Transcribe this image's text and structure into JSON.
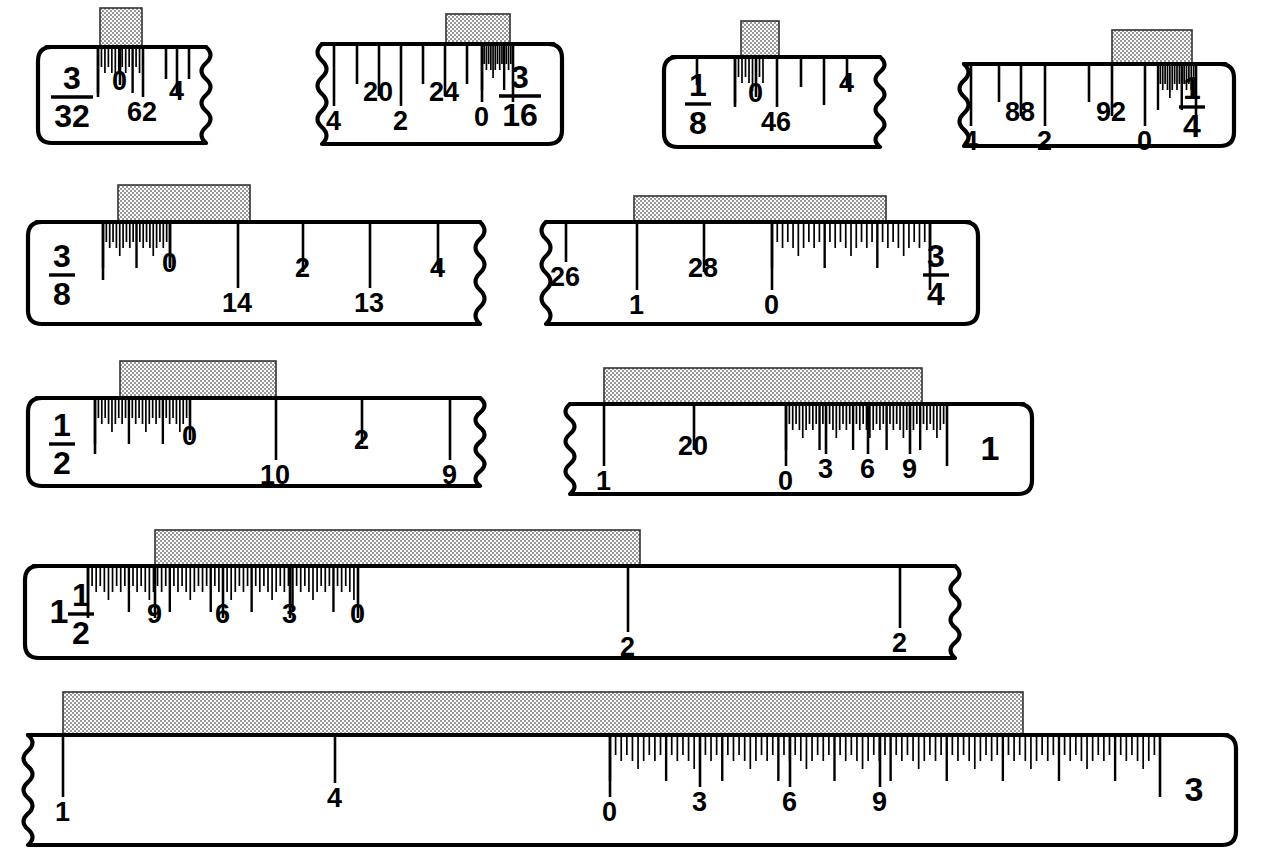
{
  "figure": {
    "type": "technical-illustration",
    "background_color": "#ffffff",
    "line_color": "#000000",
    "block_fill": "#b0b0b0",
    "block_pattern": "checkerboard-hatch",
    "rule_count": 10
  },
  "rules": [
    {
      "id": "rule-3-32",
      "size_label": {
        "numerator": "3",
        "denominator": "32"
      },
      "row": 1,
      "body": {
        "x": 38,
        "y": 47,
        "w": 168,
        "h": 96
      },
      "left_edge": "round",
      "right_edge": "torn",
      "block": {
        "x": 100,
        "y": 8,
        "w": 42,
        "h": 40
      },
      "fine_zone": {
        "x0": 98,
        "x1": 143,
        "count": 13
      },
      "major_ticks": [
        {
          "x": 98,
          "len": 50,
          "label": ""
        },
        {
          "x": 120,
          "len": 38,
          "label": "0",
          "label_pos": "upper"
        },
        {
          "x": 143,
          "len": 50,
          "label": "62",
          "label_pos": "lower"
        },
        {
          "x": 166,
          "len": 32,
          "label": ""
        },
        {
          "x": 177,
          "len": 48,
          "label": "4",
          "label_pos": "upper"
        },
        {
          "x": 189,
          "len": 32,
          "label": ""
        }
      ],
      "tick_labels": [
        "0",
        "62",
        "4"
      ]
    },
    {
      "id": "rule-3-16",
      "size_label": {
        "numerator": "3",
        "denominator": "16"
      },
      "row": 1,
      "body": {
        "x": 322,
        "y": 44,
        "w": 240,
        "h": 100
      },
      "left_edge": "torn",
      "right_edge": "round",
      "block": {
        "x": 446,
        "y": 14,
        "w": 64,
        "h": 34
      },
      "fine_zone": {
        "x0": 482,
        "x1": 513,
        "count": 14
      },
      "major_ticks": [
        {
          "x": 334,
          "len": 62,
          "label": "4",
          "label_pos": "lower"
        },
        {
          "x": 357,
          "len": 40,
          "label": ""
        },
        {
          "x": 379,
          "len": 52,
          "label": "20",
          "label_pos": "upper"
        },
        {
          "x": 401,
          "len": 62,
          "label": "2",
          "label_pos": "lower"
        },
        {
          "x": 423,
          "len": 40,
          "label": ""
        },
        {
          "x": 445,
          "len": 52,
          "label": "24",
          "label_pos": "upper"
        },
        {
          "x": 467,
          "len": 40,
          "label": ""
        },
        {
          "x": 482,
          "len": 58,
          "label": "0",
          "label_pos": "lower"
        },
        {
          "x": 513,
          "len": 58,
          "label": ""
        }
      ],
      "tick_labels": [
        "4",
        "20",
        "2",
        "24",
        "0"
      ]
    },
    {
      "id": "rule-1-8",
      "size_label": {
        "numerator": "1",
        "denominator": "8"
      },
      "row": 1,
      "body": {
        "x": 664,
        "y": 57,
        "w": 216,
        "h": 90
      },
      "left_edge": "round",
      "right_edge": "torn",
      "block": {
        "x": 741,
        "y": 21,
        "w": 38,
        "h": 36
      },
      "fine_zone": {
        "x0": 735,
        "x1": 763,
        "count": 8
      },
      "major_ticks": [
        {
          "x": 697,
          "len": 28,
          "label": ""
        },
        {
          "x": 735,
          "len": 50,
          "label": ""
        },
        {
          "x": 756,
          "len": 40,
          "label": "0",
          "label_pos": "upper"
        },
        {
          "x": 777,
          "len": 50,
          "label": "46",
          "label_pos": "lower"
        },
        {
          "x": 801,
          "len": 30,
          "label": ""
        },
        {
          "x": 824,
          "len": 48,
          "label": ""
        },
        {
          "x": 847,
          "len": 30,
          "label": "4",
          "label_pos": "upper"
        }
      ],
      "tick_labels": [
        "0",
        "46",
        "4"
      ]
    },
    {
      "id": "rule-1-4",
      "size_label": {
        "numerator": "1",
        "denominator": "4"
      },
      "row": 1,
      "body": {
        "x": 964,
        "y": 64,
        "w": 270,
        "h": 82
      },
      "left_edge": "torn",
      "right_edge": "round",
      "block": {
        "x": 1112,
        "y": 30,
        "w": 80,
        "h": 34
      },
      "fine_zone": {
        "x0": 1158,
        "x1": 1196,
        "count": 16
      },
      "major_ticks": [
        {
          "x": 971,
          "len": 62,
          "label": "4",
          "label_pos": "lower"
        },
        {
          "x": 999,
          "len": 38,
          "label": ""
        },
        {
          "x": 1021,
          "len": 52,
          "label": "88",
          "label_pos": "upper"
        },
        {
          "x": 1045,
          "len": 62,
          "label": "2",
          "label_pos": "lower"
        },
        {
          "x": 1089,
          "len": 38,
          "label": ""
        },
        {
          "x": 1112,
          "len": 52,
          "label": "92",
          "label_pos": "upper"
        },
        {
          "x": 1145,
          "len": 62,
          "label": "0",
          "label_pos": "lower"
        },
        {
          "x": 1196,
          "len": 62,
          "label": ""
        }
      ],
      "tick_labels": [
        "4",
        "88",
        "2",
        "92",
        "0"
      ]
    },
    {
      "id": "rule-3-8",
      "size_label": {
        "numerator": "3",
        "denominator": "8"
      },
      "row": 2,
      "body": {
        "x": 28,
        "y": 222,
        "w": 452,
        "h": 102
      },
      "left_edge": "round",
      "right_edge": "torn",
      "block": {
        "x": 118,
        "y": 185,
        "w": 132,
        "h": 37
      },
      "fine_zone": {
        "x0": 103,
        "x1": 170,
        "count": 20
      },
      "major_ticks": [
        {
          "x": 103,
          "len": 58,
          "label": ""
        },
        {
          "x": 170,
          "len": 45,
          "label": "0",
          "label_pos": "upper"
        },
        {
          "x": 238,
          "len": 66,
          "label": "14",
          "label_pos": "lower"
        },
        {
          "x": 303,
          "len": 50,
          "label": "2",
          "label_pos": "upper"
        },
        {
          "x": 370,
          "len": 66,
          "label": "13",
          "label_pos": "lower"
        },
        {
          "x": 438,
          "len": 50,
          "label": "4",
          "label_pos": "upper"
        }
      ],
      "tick_labels": [
        "0",
        "14",
        "2",
        "13",
        "4"
      ]
    },
    {
      "id": "rule-3-4",
      "size_label": {
        "numerator": "3",
        "denominator": "4"
      },
      "row": 2,
      "body": {
        "x": 546,
        "y": 222,
        "w": 432,
        "h": 102
      },
      "left_edge": "torn",
      "right_edge": "round",
      "block": {
        "x": 634,
        "y": 196,
        "w": 252,
        "h": 31
      },
      "fine_zone": {
        "x0": 772,
        "x1": 930,
        "count": 30
      },
      "major_ticks": [
        {
          "x": 566,
          "len": 40,
          "label": "26",
          "label_pos": "lower"
        },
        {
          "x": 637,
          "len": 68,
          "label": "1",
          "label_pos": "lower"
        },
        {
          "x": 704,
          "len": 50,
          "label": "28",
          "label_pos": "upper"
        },
        {
          "x": 772,
          "len": 68,
          "label": "0",
          "label_pos": "lower"
        },
        {
          "x": 930,
          "len": 68,
          "label": ""
        }
      ],
      "tick_labels": [
        "26",
        "1",
        "28",
        "0"
      ]
    },
    {
      "id": "rule-1-2",
      "size_label": {
        "numerator": "1",
        "denominator": "2"
      },
      "row": 3,
      "body": {
        "x": 28,
        "y": 398,
        "w": 452,
        "h": 88
      },
      "left_edge": "round",
      "right_edge": "torn",
      "block": {
        "x": 120,
        "y": 361,
        "w": 156,
        "h": 37
      },
      "fine_zone": {
        "x0": 95,
        "x1": 190,
        "count": 28
      },
      "major_ticks": [
        {
          "x": 95,
          "len": 56,
          "label": ""
        },
        {
          "x": 190,
          "len": 42,
          "label": "0",
          "label_pos": "upper"
        },
        {
          "x": 276,
          "len": 62,
          "label": "10",
          "label_pos": "lower"
        },
        {
          "x": 362,
          "len": 46,
          "label": "2",
          "label_pos": "upper"
        },
        {
          "x": 450,
          "len": 62,
          "label": "9",
          "label_pos": "lower"
        }
      ],
      "tick_labels": [
        "0",
        "10",
        "2",
        "9"
      ]
    },
    {
      "id": "rule-1",
      "size_label": {
        "whole": "1"
      },
      "row": 3,
      "body": {
        "x": 570,
        "y": 404,
        "w": 462,
        "h": 90
      },
      "left_edge": "torn",
      "right_edge": "round",
      "block": {
        "x": 604,
        "y": 368,
        "w": 318,
        "h": 36
      },
      "fine_zone": {
        "x0": 786,
        "x1": 947,
        "count": 48
      },
      "major_ticks": [
        {
          "x": 604,
          "len": 62,
          "label": "1",
          "label_pos": "lower"
        },
        {
          "x": 694,
          "len": 46,
          "label": "20",
          "label_pos": "upper"
        },
        {
          "x": 786,
          "len": 62,
          "label": "0",
          "label_pos": "lower"
        },
        {
          "x": 826,
          "len": 50,
          "label": "3",
          "label_pos": "lower"
        },
        {
          "x": 868,
          "len": 50,
          "label": "6",
          "label_pos": "lower"
        },
        {
          "x": 910,
          "len": 50,
          "label": "9",
          "label_pos": "lower"
        },
        {
          "x": 947,
          "len": 62,
          "label": ""
        }
      ],
      "tick_labels": [
        "1",
        "20",
        "0",
        "3",
        "6",
        "9"
      ]
    },
    {
      "id": "rule-1-1-2",
      "size_label": {
        "whole": "1",
        "numerator": "1",
        "denominator": "2"
      },
      "row": 4,
      "body": {
        "x": 25,
        "y": 566,
        "w": 930,
        "h": 92
      },
      "left_edge": "round",
      "right_edge": "torn",
      "block": {
        "x": 155,
        "y": 530,
        "w": 485,
        "h": 37
      },
      "fine_zone": {
        "x0": 88,
        "x1": 358,
        "count": 66
      },
      "major_ticks": [
        {
          "x": 88,
          "len": 52,
          "label": ""
        },
        {
          "x": 155,
          "len": 52,
          "label": "9",
          "label_pos": "upper"
        },
        {
          "x": 223,
          "len": 52,
          "label": "6",
          "label_pos": "upper"
        },
        {
          "x": 290,
          "len": 52,
          "label": "3",
          "label_pos": "upper"
        },
        {
          "x": 358,
          "len": 52,
          "label": "0",
          "label_pos": "upper"
        },
        {
          "x": 628,
          "len": 66,
          "label": "2",
          "label_pos": "lower"
        },
        {
          "x": 900,
          "len": 62,
          "label": "2",
          "label_pos": "lower"
        }
      ],
      "tick_labels": [
        "9",
        "6",
        "3",
        "0",
        "2",
        "2"
      ]
    },
    {
      "id": "rule-3",
      "size_label": {
        "whole": "3"
      },
      "row": 5,
      "body": {
        "x": 28,
        "y": 735,
        "w": 1208,
        "h": 110
      },
      "left_edge": "torn",
      "right_edge": "round",
      "block": {
        "x": 63,
        "y": 692,
        "w": 960,
        "h": 46
      },
      "fine_zone": {
        "x0": 610,
        "x1": 1160,
        "count": 98
      },
      "major_ticks": [
        {
          "x": 63,
          "len": 62,
          "label": "1",
          "label_pos": "lower"
        },
        {
          "x": 335,
          "len": 48,
          "label": "4",
          "label_pos": "lower"
        },
        {
          "x": 610,
          "len": 62,
          "label": "0",
          "label_pos": "lower"
        },
        {
          "x": 700,
          "len": 52,
          "label": "3",
          "label_pos": "lower"
        },
        {
          "x": 790,
          "len": 52,
          "label": "6",
          "label_pos": "lower"
        },
        {
          "x": 880,
          "len": 52,
          "label": "9",
          "label_pos": "lower"
        },
        {
          "x": 1160,
          "len": 62,
          "label": ""
        }
      ],
      "tick_labels": [
        "1",
        "4",
        "0",
        "3",
        "6",
        "9"
      ]
    }
  ]
}
